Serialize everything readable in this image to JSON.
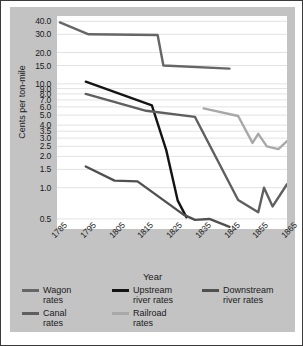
{
  "chart_data": {
    "type": "line",
    "title": "",
    "xlabel": "Year",
    "ylabel": "Cents per ton-mile",
    "yscale": "log",
    "ylim": [
      0.4,
      45
    ],
    "xlim": [
      1785,
      1865
    ],
    "grid": true,
    "legend_position": "bottom",
    "xticks": [
      "1785",
      "1795",
      "1805",
      "1815",
      "1825",
      "1835",
      "1845",
      "1855",
      "1865"
    ],
    "yticks": [
      "40.0",
      "30.0",
      "20.0",
      "15.0",
      "10.0",
      "9.0",
      "8.0",
      "7.0",
      "6.0",
      "5.0",
      "4.0",
      "3.5",
      "3.0",
      "2.5",
      "2.0",
      "1.5",
      "1.0",
      "0.5"
    ],
    "ytick_values": [
      40.0,
      30.0,
      20.0,
      15.0,
      10.0,
      9.0,
      8.0,
      7.0,
      6.0,
      5.0,
      4.0,
      3.5,
      3.0,
      2.5,
      2.0,
      1.5,
      1.0,
      0.5
    ],
    "series": [
      {
        "name": "Wagon rates",
        "color": "#666666",
        "width": 2.4,
        "x": [
          1786,
          1796,
          1820,
          1822,
          1845
        ],
        "y": [
          39.0,
          30.0,
          29.5,
          15.0,
          14.0
        ]
      },
      {
        "name": "Upstream river rates",
        "color": "#141414",
        "width": 2.4,
        "x": [
          1795,
          1818,
          1823,
          1827,
          1830
        ],
        "y": [
          10.5,
          6.2,
          2.3,
          0.75,
          0.52
        ]
      },
      {
        "name": "Downstream river rates",
        "color": "#505050",
        "width": 2.4,
        "x": [
          1795,
          1805,
          1813,
          1829,
          1833,
          1838,
          1845
        ],
        "y": [
          1.6,
          1.17,
          1.15,
          0.55,
          0.49,
          0.5,
          0.42
        ]
      },
      {
        "name": "Canal rates",
        "color": "#5f5f5f",
        "width": 2.4,
        "x": [
          1795,
          1816,
          1833,
          1848,
          1855,
          1857,
          1860,
          1865
        ],
        "y": [
          8.0,
          5.5,
          4.8,
          0.76,
          0.58,
          1.0,
          0.66,
          1.08
        ]
      },
      {
        "name": "Railroad rates",
        "color": "#a8a8a8",
        "width": 2.4,
        "x": [
          1836,
          1848,
          1853,
          1855,
          1858,
          1862,
          1865
        ],
        "y": [
          5.8,
          4.9,
          2.7,
          3.3,
          2.5,
          2.35,
          2.8
        ]
      }
    ]
  },
  "legend": {
    "rows": [
      [
        {
          "label": "Wagon\nrates",
          "color": "#666666"
        },
        {
          "label": "Upstream\nriver rates",
          "color": "#141414"
        },
        {
          "label": "Downstream\nriver rates",
          "color": "#505050"
        }
      ],
      [
        {
          "label": "Canal\nrates",
          "color": "#5f5f5f"
        },
        {
          "label": "Railroad\nrates",
          "color": "#a8a8a8"
        }
      ]
    ]
  },
  "colors": {
    "panel": "#c3c3c3",
    "plot_background": "#ffffff",
    "grid": "#e2e2e2",
    "text": "#1a1a1a",
    "frame_border": "#3a3a3a"
  }
}
